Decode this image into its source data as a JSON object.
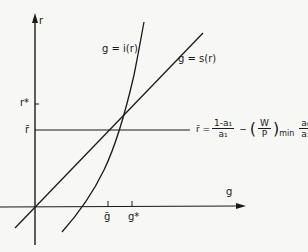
{
  "axes": {
    "y_label": "r",
    "x_label": "g",
    "y_ticks": [
      {
        "label": "r*",
        "y": 104
      },
      {
        "label": "r̄",
        "y": 130
      }
    ],
    "x_ticks": [
      {
        "label": "ḡ",
        "x": 108
      },
      {
        "label": "g*",
        "x": 132
      }
    ]
  },
  "curves": {
    "investment": {
      "label": "g = i(r)"
    },
    "savings": {
      "label": "g = s(r)"
    },
    "rbar_line": {
      "equation": {
        "lhs": "r̄ =",
        "frac1_num": "1-a₁",
        "frac1_den": "a₁",
        "minus": "−",
        "paren_open": "(",
        "frac2_num": "W",
        "frac2_den": "P",
        "paren_close": ")",
        "subscript": "min",
        "frac3_num": "a₀",
        "frac3_den": "a₁"
      }
    }
  },
  "colors": {
    "background": "#f7f7f5",
    "ink": "#1a1a1a"
  }
}
